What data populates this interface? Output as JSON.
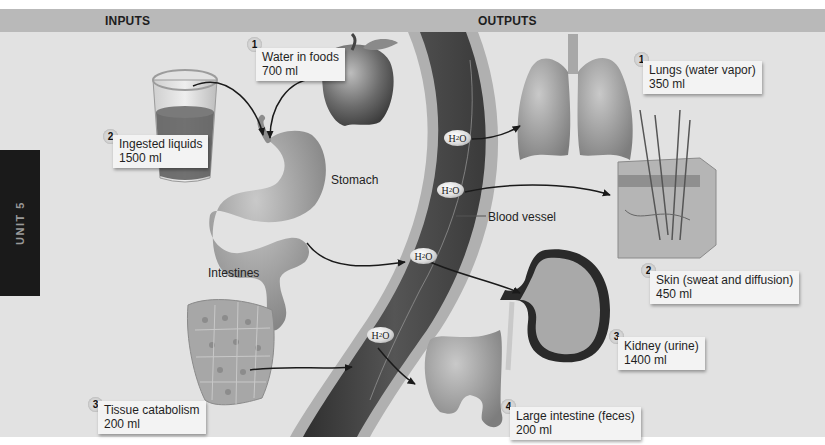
{
  "headers": {
    "inputs": "INPUTS",
    "outputs": "OUTPUTS"
  },
  "side_tab": {
    "label": "UNIT 5"
  },
  "inputs": [
    {
      "number": "1",
      "name": "Water in foods",
      "amount": "700 ml"
    },
    {
      "number": "2",
      "name": "Ingested liquids",
      "amount": "1500 ml"
    },
    {
      "number": "3",
      "name": "Tissue catabolism",
      "amount": "200 ml"
    }
  ],
  "outputs": [
    {
      "number": "1",
      "name": "Lungs (water vapor)",
      "amount": "350 ml"
    },
    {
      "number": "2",
      "name": "Skin (sweat and diffusion)",
      "amount": "450 ml"
    },
    {
      "number": "3",
      "name": "Kidney (urine)",
      "amount": "1400 ml"
    },
    {
      "number": "4",
      "name": "Large intestine (feces)",
      "amount": "200 ml"
    }
  ],
  "labels": {
    "stomach": "Stomach",
    "intestines": "Intestines",
    "blood_vessel": "Blood vessel"
  },
  "molecule": {
    "symbol_main": "H",
    "symbol_sub": "2",
    "symbol_end": "O"
  },
  "colors": {
    "background": "#e2e2e2",
    "header_band": "#b9b9b9",
    "vessel_dark": "#3e3e3e",
    "vessel_wall": "#a8a8a8",
    "side_tab": "#1a1a1a"
  }
}
